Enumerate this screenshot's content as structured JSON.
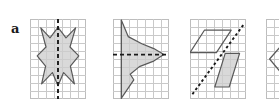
{
  "figure": {
    "kind": "geometry-symmetry-worksheet",
    "background_color": "#ffffff",
    "grid_line_color": "#c9c9c9",
    "grid_border_color": "#bdbdbd",
    "shape_outline_color": "#595959",
    "shape_fill_color": "#cccccc",
    "dashed_line_color": "#1a1a1a",
    "label_color": "#1a1a1a"
  },
  "panels": [
    {
      "label": "a",
      "grid_columns": 7,
      "grid_rows": 10,
      "cell_size": 8,
      "symmetry_line": {
        "orientation": "vertical",
        "label": "vertical dashed line",
        "x_grid": 3.5,
        "dash_pattern": "4,3"
      },
      "shapes": [
        {
          "name": "butterfly-polygon",
          "type": "polygon",
          "filled": true,
          "points_grid": [
            [
              1.35,
              1.1
            ],
            [
              2.5,
              2.35
            ],
            [
              3.5,
              1.05
            ],
            [
              4.5,
              2.35
            ],
            [
              5.7,
              1.1
            ],
            [
              5.0,
              3.5
            ],
            [
              6.1,
              4.6
            ],
            [
              5.05,
              5.9
            ],
            [
              5.55,
              8.1
            ],
            [
              4.2,
              6.7
            ],
            [
              3.5,
              8.35
            ],
            [
              2.8,
              6.7
            ],
            [
              1.45,
              8.1
            ],
            [
              1.95,
              5.9
            ],
            [
              0.9,
              4.6
            ],
            [
              2.0,
              3.5
            ]
          ]
        }
      ]
    },
    {
      "label": "b",
      "grid_columns": 7,
      "grid_rows": 10,
      "cell_size": 8,
      "symmetry_line": {
        "orientation": "horizontal",
        "label": "horizontal dashed line",
        "y_grid": 4.45,
        "dash_pattern": "4,3"
      },
      "shapes": [
        {
          "name": "arrow-leaf-polygon",
          "type": "polygon",
          "filled": true,
          "points_grid": [
            [
              1.05,
              0.15
            ],
            [
              1.9,
              2.2
            ],
            [
              3.6,
              3.1
            ],
            [
              5.1,
              3.7
            ],
            [
              6.35,
              4.45
            ],
            [
              5.0,
              5.3
            ],
            [
              3.3,
              5.95
            ],
            [
              2.15,
              6.9
            ],
            [
              2.6,
              7.6
            ],
            [
              1.05,
              9.9
            ]
          ]
        },
        {
          "name": "left-vertical-edge",
          "type": "line",
          "from_grid": [
            1.05,
            0.15
          ],
          "to_grid": [
            1.05,
            9.9
          ]
        }
      ]
    },
    {
      "label": "c",
      "grid_columns": 7,
      "grid_rows": 10,
      "cell_size": 8,
      "symmetry_line": {
        "orientation": "diagonal",
        "label": "diagonal dashed line",
        "from_grid": [
          0.3,
          9.4
        ],
        "to_grid": [
          6.7,
          0.7
        ],
        "dash_pattern": "2.6,2.6"
      },
      "shapes": [
        {
          "name": "upper-left-parallelogram",
          "type": "polygon",
          "filled": false,
          "points_grid": [
            [
              1.8,
              1.4
            ],
            [
              5.15,
              1.4
            ],
            [
              3.3,
              4.2
            ],
            [
              0.0,
              4.2
            ]
          ]
        },
        {
          "name": "lower-right-parallelogram",
          "type": "polygon",
          "filled": true,
          "points_grid": [
            [
              4.4,
              4.3
            ],
            [
              6.2,
              4.3
            ],
            [
              4.9,
              8.5
            ],
            [
              3.1,
              8.5
            ]
          ]
        }
      ]
    },
    {
      "label": "d",
      "grid_columns": 2,
      "grid_rows": 10,
      "cell_size": 8,
      "clipped_at_right_edge": true,
      "symmetry_line": null,
      "shapes": [
        {
          "name": "chevron-partial-polygon",
          "type": "polyline",
          "filled": false,
          "points_grid": [
            [
              2.2,
              3.0
            ],
            [
              0.45,
              5.0
            ],
            [
              2.2,
              7.1
            ]
          ]
        }
      ]
    }
  ],
  "labels": {
    "a": "a",
    "b": "b",
    "c": "c",
    "d": "d"
  }
}
